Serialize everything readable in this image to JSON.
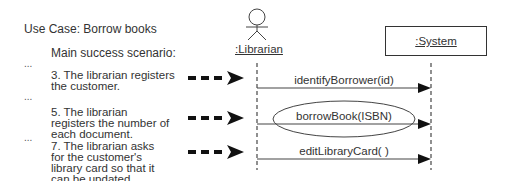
{
  "use_case": {
    "title": "Use Case: Borrow books",
    "scenario_heading": "Main success scenario:",
    "ellipsis": "...",
    "steps": [
      {
        "text": "3. The librarian registers the customer."
      },
      {
        "text": "5. The librarian registers the number of each document."
      },
      {
        "text": "7. The librarian asks for the customer's library card so that it can be updated."
      }
    ]
  },
  "sequence": {
    "actor": {
      "label": ":Librarian",
      "icon": "stick-figure-icon"
    },
    "object": {
      "label": ":System"
    },
    "messages": [
      {
        "label": "identifyBorrower(id)",
        "highlighted": false
      },
      {
        "label": "borrowBook(ISBN)",
        "highlighted": true
      },
      {
        "label": "editLibraryCard( )",
        "highlighted": false
      }
    ]
  },
  "colors": {
    "line": "#333333",
    "text": "#333333",
    "background": "#ffffff"
  }
}
